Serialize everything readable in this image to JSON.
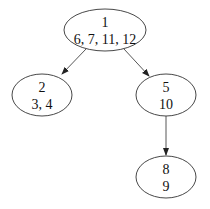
{
  "diagram": {
    "type": "tree",
    "nodes": [
      {
        "id": "n1",
        "line1": "1",
        "line2": "6, 7, 11, 12",
        "cx": 105,
        "cy": 30,
        "rx": 41,
        "ry": 21
      },
      {
        "id": "n2",
        "line1": "2",
        "line2": "3, 4",
        "cx": 42,
        "cy": 95,
        "rx": 30,
        "ry": 21
      },
      {
        "id": "n5",
        "line1": "5",
        "line2": "10",
        "cx": 166,
        "cy": 95,
        "rx": 30,
        "ry": 21
      },
      {
        "id": "n8",
        "line1": "8",
        "line2": "9",
        "cx": 166,
        "cy": 177,
        "rx": 30,
        "ry": 21
      }
    ],
    "edges": [
      {
        "from": "n1",
        "to": "n2"
      },
      {
        "from": "n1",
        "to": "n5"
      },
      {
        "from": "n5",
        "to": "n8"
      }
    ]
  }
}
